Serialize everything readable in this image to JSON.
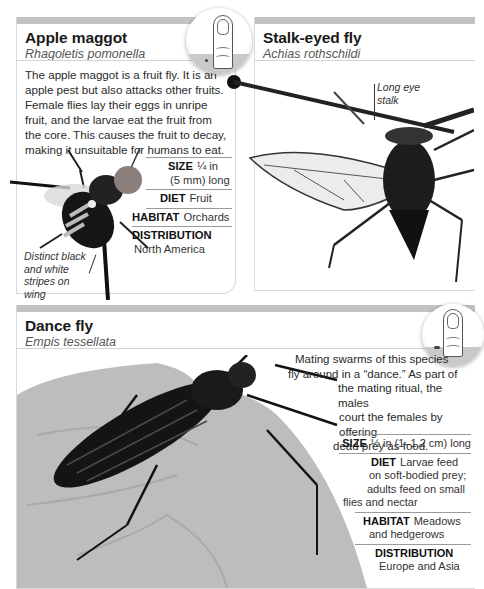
{
  "cards": {
    "apple_maggot": {
      "title": "Apple maggot",
      "scientific_name": "Rhagoletis pomonella",
      "description": "The apple maggot is a fruit fly. It is an apple pest but also attacks other fruits. Female flies lay their eggs in unripe fruit, and the larvae eat the fruit from the core. This causes the fruit to decay, making it unsuitable for humans to eat.",
      "facts": {
        "size_label": "SIZE",
        "size_value_1": "¼ in",
        "size_value_2": "(5 mm) long",
        "diet_label": "DIET",
        "diet_value": "Fruit",
        "habitat_label": "HABITAT",
        "habitat_value": "Orchards",
        "distribution_label": "DISTRIBUTION",
        "distribution_value": "North America"
      },
      "annotation": "Distinct black and white stripes on wing",
      "scale_icon": "thumb-scale-icon"
    },
    "stalk_eyed_fly": {
      "title": "Stalk-eyed fly",
      "scientific_name": "Achias rothschildi",
      "annotation": "Long eye stalk"
    },
    "dance_fly": {
      "title": "Dance fly",
      "scientific_name": "Empis tessellata",
      "description_lines": [
        "Mating swarms of this species",
        "fly around in a “dance.” As part of",
        "the mating ritual, the males",
        "court the females by offering",
        "dead prey as food."
      ],
      "facts": {
        "size_label": "SIZE",
        "size_value": "½ in (1–1.2 cm) long",
        "diet_label": "DIET",
        "diet_lines": [
          "Larvae feed",
          "on soft-bodied prey;",
          "adults feed on small",
          "flies and nectar"
        ],
        "habitat_label": "HABITAT",
        "habitat_lines": [
          "Meadows",
          "and hedgerows"
        ],
        "distribution_label": "DISTRIBUTION",
        "distribution_value": "Europe and Asia"
      },
      "scale_icon": "thumb-scale-icon"
    }
  },
  "colors": {
    "header_bar": "#c3c3c3",
    "rule": "#d4d4d4",
    "text": "#1a1a1a"
  }
}
